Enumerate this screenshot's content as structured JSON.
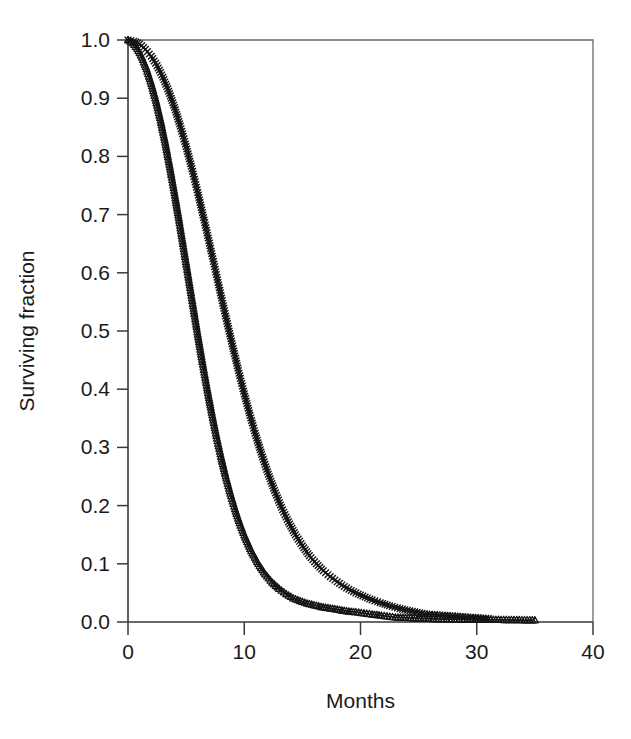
{
  "figure": {
    "background_color": "#ffffff",
    "ink_color": "#141414",
    "frame_color": "#6a6a6a",
    "caption_sliver_text": ""
  },
  "axes": {
    "x_title": "Months",
    "y_title": "Surviving fraction",
    "x_ticks": [
      "0",
      "10",
      "20",
      "30",
      "40"
    ],
    "y_ticks": [
      "0.0",
      "0.1",
      "0.2",
      "0.3",
      "0.4",
      "0.5",
      "0.6",
      "0.7",
      "0.8",
      "0.9",
      "1.0"
    ]
  },
  "chart_data": {
    "type": "line",
    "title": "",
    "subtitle": "",
    "xlabel": "Months",
    "ylabel": "Surviving fraction",
    "xlim": [
      0,
      40
    ],
    "ylim": [
      0.0,
      1.0
    ],
    "xticks": [
      0,
      10,
      20,
      30,
      40
    ],
    "yticks": [
      0.0,
      0.1,
      0.2,
      0.3,
      0.4,
      0.5,
      0.6,
      0.7,
      0.8,
      0.9,
      1.0
    ],
    "grid": false,
    "legend": "none",
    "legend_position": "none",
    "annotations": [],
    "series": [
      {
        "name": "Group A",
        "marker": "triangle",
        "marker_symbol": "triangle-up-open",
        "median_survival_months": 4.7,
        "x": [
          0.0,
          0.4,
          0.8,
          1.2,
          1.6,
          2.0,
          2.4,
          2.8,
          3.2,
          3.6,
          4.0,
          4.4,
          4.8,
          5.2,
          5.6,
          6.0,
          6.4,
          6.8,
          7.2,
          7.6,
          8.0,
          8.4,
          8.8,
          9.2,
          9.6,
          10.0,
          10.6,
          11.2,
          11.8,
          12.4,
          13.0,
          13.6,
          14.2,
          14.8,
          15.4,
          16.0,
          16.6,
          17.2,
          17.8,
          18.4,
          19.0,
          19.6,
          20.3,
          21.0,
          21.8,
          23.0,
          26.5,
          35.0
        ],
        "y": [
          1.0,
          0.995,
          0.985,
          0.97,
          0.95,
          0.925,
          0.896,
          0.862,
          0.824,
          0.782,
          0.737,
          0.69,
          0.641,
          0.592,
          0.543,
          0.494,
          0.447,
          0.402,
          0.36,
          0.32,
          0.284,
          0.251,
          0.221,
          0.194,
          0.17,
          0.149,
          0.122,
          0.1,
          0.082,
          0.068,
          0.057,
          0.048,
          0.041,
          0.036,
          0.032,
          0.029,
          0.026,
          0.024,
          0.022,
          0.02,
          0.018,
          0.017,
          0.015,
          0.013,
          0.011,
          0.008,
          0.005,
          0.003
        ]
      },
      {
        "name": "Group B",
        "marker": "cross",
        "marker_symbol": "x-thin",
        "median_survival_months": 7.3,
        "x": [
          0.0,
          0.5,
          1.0,
          1.5,
          2.0,
          2.5,
          3.0,
          3.5,
          4.0,
          4.5,
          5.0,
          5.5,
          6.0,
          6.5,
          7.0,
          7.5,
          8.0,
          8.5,
          9.0,
          9.5,
          10.0,
          10.5,
          11.0,
          11.5,
          12.0,
          12.6,
          13.2,
          13.8,
          14.4,
          15.0,
          15.6,
          16.2,
          16.8,
          17.4,
          18.0,
          18.6,
          19.2,
          19.8,
          20.4,
          21.0,
          21.7,
          22.5,
          23.4,
          25.5,
          31.0
        ],
        "y": [
          1.0,
          0.998,
          0.993,
          0.984,
          0.972,
          0.956,
          0.936,
          0.912,
          0.884,
          0.852,
          0.817,
          0.779,
          0.738,
          0.695,
          0.651,
          0.606,
          0.561,
          0.517,
          0.474,
          0.432,
          0.392,
          0.355,
          0.32,
          0.288,
          0.258,
          0.226,
          0.197,
          0.172,
          0.15,
          0.131,
          0.114,
          0.1,
          0.088,
          0.078,
          0.069,
          0.061,
          0.054,
          0.048,
          0.043,
          0.038,
          0.033,
          0.028,
          0.023,
          0.014,
          0.006
        ]
      }
    ]
  }
}
